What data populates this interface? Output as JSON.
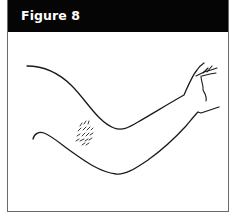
{
  "figure": {
    "title": "Figure 8",
    "header_color": "#050505",
    "title_color": "#ffffff",
    "border_color": "#6a6a6a",
    "line_color": "#1a1a1a"
  },
  "illustration": {
    "subject": "outstretched arm (side view) with rash marks on the inner forearm/elbow area",
    "elements": [
      "arm-upper-contour",
      "arm-lower-contour",
      "hand-detail",
      "rash-marks"
    ]
  }
}
